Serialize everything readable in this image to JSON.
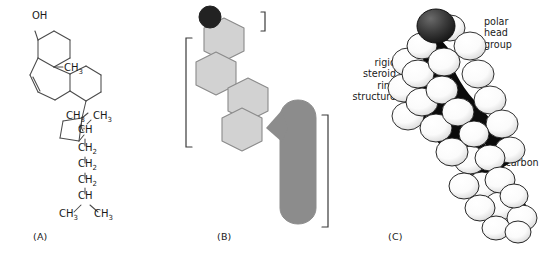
{
  "figure": {
    "background_color": "#ffffff",
    "text_color": "#1a1a1a"
  },
  "panels": [
    {
      "id": "A",
      "label": "(A)",
      "name": "structural-formula",
      "description": "Chemical structural formula of cholesterol",
      "atom_labels": [
        {
          "text": "OH",
          "x": 40,
          "y": 22
        },
        {
          "text": "CH",
          "x": 67,
          "y": 72,
          "sub": "3"
        },
        {
          "text": "CH",
          "x": 72,
          "y": 119,
          "sub": "3"
        },
        {
          "text": "CH",
          "x": 97,
          "y": 119,
          "sub": "3"
        },
        {
          "text": "CH",
          "x": 83,
          "y": 134
        },
        {
          "text": "CH",
          "x": 83,
          "y": 152,
          "sub": "2"
        },
        {
          "text": "CH",
          "x": 83,
          "y": 168,
          "sub": "2"
        },
        {
          "text": "CH",
          "x": 83,
          "y": 183,
          "sub": "2"
        },
        {
          "text": "CH",
          "x": 83,
          "y": 199
        },
        {
          "text": "CH",
          "x": 65,
          "y": 216,
          "sub": "3"
        },
        {
          "text": "CH",
          "x": 100,
          "y": 216,
          "sub": "3"
        }
      ]
    },
    {
      "id": "B",
      "label": "(B)",
      "name": "schematic-diagram",
      "description": "Schematic of cholesterol: polar head group, rigid steroid ring structure, nonpolar hydrocarbon tail",
      "colors": {
        "head_group": "#222222",
        "steroid_rings": "#d2d2d2",
        "ring_outline": "#8a8a8a",
        "hydrocarbon_tail": "#8c8c8c",
        "bracket": "#3a3a3a"
      },
      "callouts": [
        {
          "name": "polar-head-group",
          "text": "polar head group",
          "align": "left"
        },
        {
          "name": "rigid-steroid-ring-structure",
          "text": "rigid\nsteroid\nring\nstructure",
          "align": "right"
        },
        {
          "name": "nonpolar-hydrocarbon-tail",
          "text": "nonpolar\nhydrocarbon\ntail",
          "align": "left"
        }
      ]
    },
    {
      "id": "C",
      "label": "(C)",
      "name": "space-filling-model",
      "description": "Space-filling (CPK) model of cholesterol with dark oxygen atom at the hydroxyl head",
      "colors": {
        "oxygen_atom": "#333333",
        "carbon_hydrogen_atoms": "#ffffff",
        "atom_outline": "#1a1a1a",
        "shadow": "#000000"
      }
    }
  ]
}
